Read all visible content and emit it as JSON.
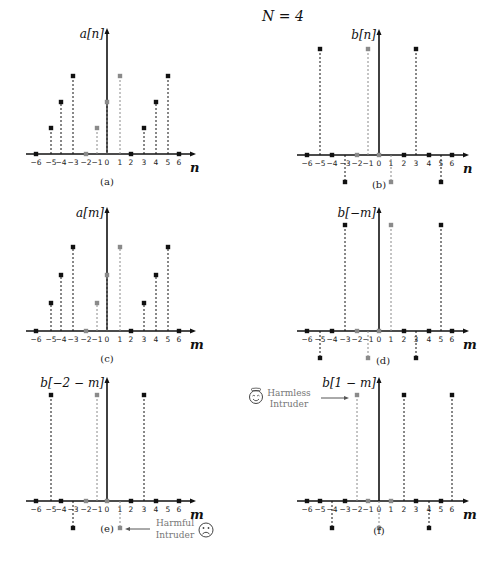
{
  "header": {
    "title": "N = 4"
  },
  "colors": {
    "black": "#111111",
    "gray": "#8a8a8a",
    "axis": "#111111"
  },
  "annotations": {
    "harmful": {
      "line1": "Harmful",
      "line2": "Intruder",
      "icon": "sad-face-icon"
    },
    "harmless": {
      "line1": "Harmless",
      "line2": "Intruder",
      "icon": "happy-halo-face-icon"
    }
  },
  "chart_data": [
    {
      "type": "stem",
      "id": "a",
      "caption": "(a)",
      "ylabel": "a[n]",
      "xlabel": "n",
      "origin": [
        107,
        154
      ],
      "xs": [
        36,
        51,
        61,
        73,
        86,
        97,
        107,
        120,
        131,
        144,
        156,
        168,
        179
      ],
      "unit": 26,
      "ytop": 32,
      "xend": 192,
      "ticks": [
        -6,
        -5,
        -4,
        -3,
        -2,
        -1,
        0,
        1,
        2,
        3,
        4,
        5,
        6
      ],
      "points": [
        {
          "n": -6,
          "v": 0,
          "gray": false
        },
        {
          "n": -5,
          "v": 1,
          "gray": false
        },
        {
          "n": -4,
          "v": 2,
          "gray": false
        },
        {
          "n": -3,
          "v": 3,
          "gray": false
        },
        {
          "n": -2,
          "v": 0,
          "gray": true
        },
        {
          "n": -1,
          "v": 1,
          "gray": true
        },
        {
          "n": 0,
          "v": 2,
          "gray": true
        },
        {
          "n": 1,
          "v": 3,
          "gray": true
        },
        {
          "n": 2,
          "v": 0,
          "gray": false
        },
        {
          "n": 3,
          "v": 1,
          "gray": false
        },
        {
          "n": 4,
          "v": 2,
          "gray": false
        },
        {
          "n": 5,
          "v": 3,
          "gray": false
        },
        {
          "n": 6,
          "v": 0,
          "gray": false
        }
      ]
    },
    {
      "type": "stem",
      "id": "b",
      "caption": "(b)",
      "ylabel": "b[n]",
      "xlabel": "n",
      "origin": [
        379,
        155
      ],
      "xs": [
        307,
        320,
        332,
        345,
        357,
        368,
        379,
        391,
        404,
        416,
        429,
        441,
        452
      ],
      "unit": 106,
      "ytop": 33,
      "xend": 465,
      "neg_unit": 27,
      "ticks": [
        -6,
        -5,
        -4,
        -3,
        -2,
        -1,
        0,
        1,
        2,
        3,
        4,
        5,
        6
      ],
      "points": [
        {
          "n": -6,
          "v": 0,
          "gray": false
        },
        {
          "n": -5,
          "v": 1,
          "gray": false
        },
        {
          "n": -4,
          "v": 0,
          "gray": false
        },
        {
          "n": -3,
          "v": -1,
          "gray": false
        },
        {
          "n": -2,
          "v": 0,
          "gray": true
        },
        {
          "n": -1,
          "v": 1,
          "gray": true
        },
        {
          "n": 0,
          "v": 0,
          "gray": true
        },
        {
          "n": 1,
          "v": -1,
          "gray": true
        },
        {
          "n": 2,
          "v": 0,
          "gray": false
        },
        {
          "n": 3,
          "v": 1,
          "gray": false
        },
        {
          "n": 4,
          "v": 0,
          "gray": false
        },
        {
          "n": 5,
          "v": -1,
          "gray": false
        },
        {
          "n": 6,
          "v": 0,
          "gray": false
        }
      ]
    },
    {
      "type": "stem",
      "id": "c",
      "caption": "(c)",
      "ylabel": "a[m]",
      "xlabel": "m",
      "origin": [
        107,
        331
      ],
      "xs": [
        36,
        51,
        61,
        73,
        86,
        97,
        107,
        120,
        131,
        144,
        156,
        168,
        179
      ],
      "unit": 28,
      "ytop": 211,
      "xend": 192,
      "ticks": [
        -6,
        -5,
        -4,
        -3,
        -2,
        -1,
        0,
        1,
        2,
        3,
        4,
        5,
        6
      ],
      "points": [
        {
          "n": -6,
          "v": 0,
          "gray": false
        },
        {
          "n": -5,
          "v": 1,
          "gray": false
        },
        {
          "n": -4,
          "v": 2,
          "gray": false
        },
        {
          "n": -3,
          "v": 3,
          "gray": false
        },
        {
          "n": -2,
          "v": 0,
          "gray": true
        },
        {
          "n": -1,
          "v": 1,
          "gray": true
        },
        {
          "n": 0,
          "v": 2,
          "gray": true
        },
        {
          "n": 1,
          "v": 3,
          "gray": true
        },
        {
          "n": 2,
          "v": 0,
          "gray": false
        },
        {
          "n": 3,
          "v": 1,
          "gray": false
        },
        {
          "n": 4,
          "v": 2,
          "gray": false
        },
        {
          "n": 5,
          "v": 3,
          "gray": false
        },
        {
          "n": 6,
          "v": 0,
          "gray": false
        }
      ]
    },
    {
      "type": "stem",
      "id": "d",
      "caption": "(d)",
      "ylabel": "b[−m]",
      "xlabel": "m",
      "origin": [
        379,
        331
      ],
      "xs": [
        307,
        320,
        332,
        345,
        357,
        368,
        379,
        391,
        404,
        416,
        429,
        441,
        452
      ],
      "unit": 106,
      "ytop": 211,
      "xend": 465,
      "neg_unit": 27,
      "ticks": [
        -6,
        -5,
        -4,
        -3,
        -2,
        -1,
        0,
        1,
        2,
        3,
        4,
        5,
        6
      ],
      "points": [
        {
          "n": -6,
          "v": 0,
          "gray": false
        },
        {
          "n": -5,
          "v": -1,
          "gray": false
        },
        {
          "n": -4,
          "v": 0,
          "gray": false
        },
        {
          "n": -3,
          "v": 1,
          "gray": false
        },
        {
          "n": -2,
          "v": 0,
          "gray": true
        },
        {
          "n": -1,
          "v": -1,
          "gray": true
        },
        {
          "n": 0,
          "v": 0,
          "gray": true
        },
        {
          "n": 1,
          "v": 1,
          "gray": true
        },
        {
          "n": 2,
          "v": 0,
          "gray": false
        },
        {
          "n": 3,
          "v": -1,
          "gray": false
        },
        {
          "n": 4,
          "v": 0,
          "gray": false
        },
        {
          "n": 5,
          "v": 1,
          "gray": false
        },
        {
          "n": 6,
          "v": 0,
          "gray": false
        }
      ]
    },
    {
      "type": "stem",
      "id": "e",
      "caption": "(e)",
      "ylabel": "b[−2 − m]",
      "xlabel": "m",
      "origin": [
        107,
        501
      ],
      "xs": [
        36,
        51,
        61,
        73,
        86,
        97,
        107,
        120,
        131,
        144,
        156,
        168,
        179
      ],
      "unit": 106,
      "ytop": 381,
      "xend": 192,
      "neg_unit": 27,
      "ticks": [
        -6,
        -5,
        -4,
        -3,
        -2,
        -1,
        0,
        1,
        2,
        3,
        4,
        5,
        6
      ],
      "points": [
        {
          "n": -6,
          "v": 0,
          "gray": false
        },
        {
          "n": -5,
          "v": 1,
          "gray": false
        },
        {
          "n": -4,
          "v": 0,
          "gray": false
        },
        {
          "n": -3,
          "v": -1,
          "gray": false
        },
        {
          "n": -2,
          "v": 0,
          "gray": true
        },
        {
          "n": -1,
          "v": 1,
          "gray": true
        },
        {
          "n": 0,
          "v": 0,
          "gray": true
        },
        {
          "n": 1,
          "v": -1,
          "gray": true
        },
        {
          "n": 2,
          "v": 0,
          "gray": false
        },
        {
          "n": 3,
          "v": 1,
          "gray": false
        },
        {
          "n": 4,
          "v": 0,
          "gray": false
        },
        {
          "n": 6,
          "v": 0,
          "gray": false
        }
      ]
    },
    {
      "type": "stem",
      "id": "f",
      "caption": "(f)",
      "ylabel": "b[1 − m]",
      "xlabel": "m",
      "origin": [
        379,
        501
      ],
      "xs": [
        307,
        320,
        332,
        345,
        357,
        368,
        379,
        391,
        404,
        416,
        429,
        441,
        452
      ],
      "unit": 106,
      "ytop": 381,
      "xend": 465,
      "neg_unit": 27,
      "ticks": [
        -6,
        -5,
        -4,
        -3,
        -2,
        -1,
        0,
        1,
        2,
        3,
        4,
        5,
        6
      ],
      "points": [
        {
          "n": -6,
          "v": 0,
          "gray": false
        },
        {
          "n": -5,
          "v": 0,
          "gray": false
        },
        {
          "n": -4,
          "v": -1,
          "gray": false
        },
        {
          "n": -3,
          "v": 0,
          "gray": false
        },
        {
          "n": -2,
          "v": 1,
          "gray": true
        },
        {
          "n": -1,
          "v": 0,
          "gray": true
        },
        {
          "n": 0,
          "v": -1,
          "gray": true
        },
        {
          "n": 1,
          "v": 0,
          "gray": true
        },
        {
          "n": 2,
          "v": 1,
          "gray": false
        },
        {
          "n": 3,
          "v": 0,
          "gray": false
        },
        {
          "n": 4,
          "v": -1,
          "gray": false
        },
        {
          "n": 5,
          "v": 0,
          "gray": false
        },
        {
          "n": 6,
          "v": 1,
          "gray": false
        }
      ]
    }
  ]
}
